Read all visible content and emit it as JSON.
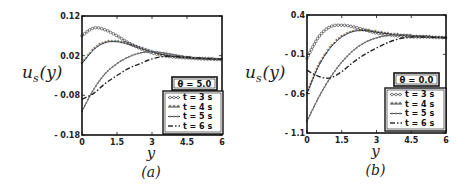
{
  "figure": {
    "panels": [
      {
        "caption": "(a)",
        "theta_label": "θ = 5.0"
      },
      {
        "caption": "(b)",
        "theta_label": "θ = 0.0"
      }
    ]
  },
  "chart_data": [
    {
      "type": "line",
      "title": "",
      "caption": "(a)",
      "annotation": "θ = 5.0",
      "xlabel": "y",
      "ylabel": "u_s(y)",
      "xlim": [
        0,
        6
      ],
      "ylim": [
        -0.18,
        0.12
      ],
      "xticks": [
        "0",
        "1.5",
        "3",
        "4.5",
        "6"
      ],
      "yticks": [
        "-0.18",
        "-0.08",
        "0.02",
        "0.12"
      ],
      "grid": false,
      "legend_position": "lower right",
      "x": [
        0,
        0.5,
        1,
        1.5,
        2,
        2.5,
        3,
        3.5,
        4,
        4.5,
        5,
        5.5,
        6
      ],
      "series": [
        {
          "name": "t = 3 s",
          "style": "line with open circles",
          "values": [
            0.07,
            0.09,
            0.085,
            0.07,
            0.052,
            0.038,
            0.027,
            0.02,
            0.016,
            0.014,
            0.012,
            0.011,
            0.01
          ]
        },
        {
          "name": "t = 4 s",
          "style": "line with filled stars",
          "values": [
            0.0,
            0.035,
            0.053,
            0.055,
            0.048,
            0.038,
            0.029,
            0.022,
            0.017,
            0.014,
            0.012,
            0.011,
            0.01
          ]
        },
        {
          "name": "t = 5 s",
          "style": "line with small circles",
          "values": [
            -0.12,
            -0.065,
            -0.025,
            0.0,
            0.017,
            0.027,
            0.03,
            0.027,
            0.022,
            0.017,
            0.014,
            0.012,
            0.011
          ]
        },
        {
          "name": "t = 6 s",
          "style": "dash-dot",
          "values": [
            -0.09,
            -0.075,
            -0.05,
            -0.03,
            -0.012,
            0.0,
            0.012,
            0.018,
            0.018,
            0.016,
            0.014,
            0.012,
            0.011
          ]
        }
      ]
    },
    {
      "type": "line",
      "title": "",
      "caption": "(b)",
      "annotation": "θ = 0.0",
      "xlabel": "y",
      "ylabel": "u_s(y)",
      "xlim": [
        0,
        6
      ],
      "ylim": [
        -1.1,
        0.4
      ],
      "xticks": [
        "0",
        "1.5",
        "3",
        "4.5",
        "6"
      ],
      "yticks": [
        "-1.1",
        "-0.6",
        "-0.1",
        "0.4"
      ],
      "grid": false,
      "legend_position": "lower right",
      "x": [
        0,
        0.5,
        1,
        1.5,
        2,
        2.5,
        3,
        3.5,
        4,
        4.5,
        5,
        5.5,
        6
      ],
      "series": [
        {
          "name": "t = 3 s",
          "style": "line with open circles",
          "values": [
            -0.15,
            0.12,
            0.25,
            0.27,
            0.25,
            0.21,
            0.17,
            0.15,
            0.13,
            0.12,
            0.12,
            0.115,
            0.11
          ]
        },
        {
          "name": "t = 4 s",
          "style": "line with filled stars",
          "values": [
            -0.6,
            -0.25,
            -0.02,
            0.12,
            0.19,
            0.2,
            0.18,
            0.16,
            0.14,
            0.13,
            0.12,
            0.115,
            0.11
          ]
        },
        {
          "name": "t = 5 s",
          "style": "line with small circles",
          "values": [
            -0.95,
            -0.65,
            -0.4,
            -0.2,
            -0.05,
            0.05,
            0.11,
            0.14,
            0.15,
            0.14,
            0.13,
            0.12,
            0.11
          ]
        },
        {
          "name": "t = 6 s",
          "style": "dash-dot",
          "values": [
            -0.3,
            -0.38,
            -0.4,
            -0.32,
            -0.2,
            -0.1,
            -0.02,
            0.05,
            0.1,
            0.12,
            0.12,
            0.115,
            0.11
          ]
        }
      ]
    }
  ]
}
